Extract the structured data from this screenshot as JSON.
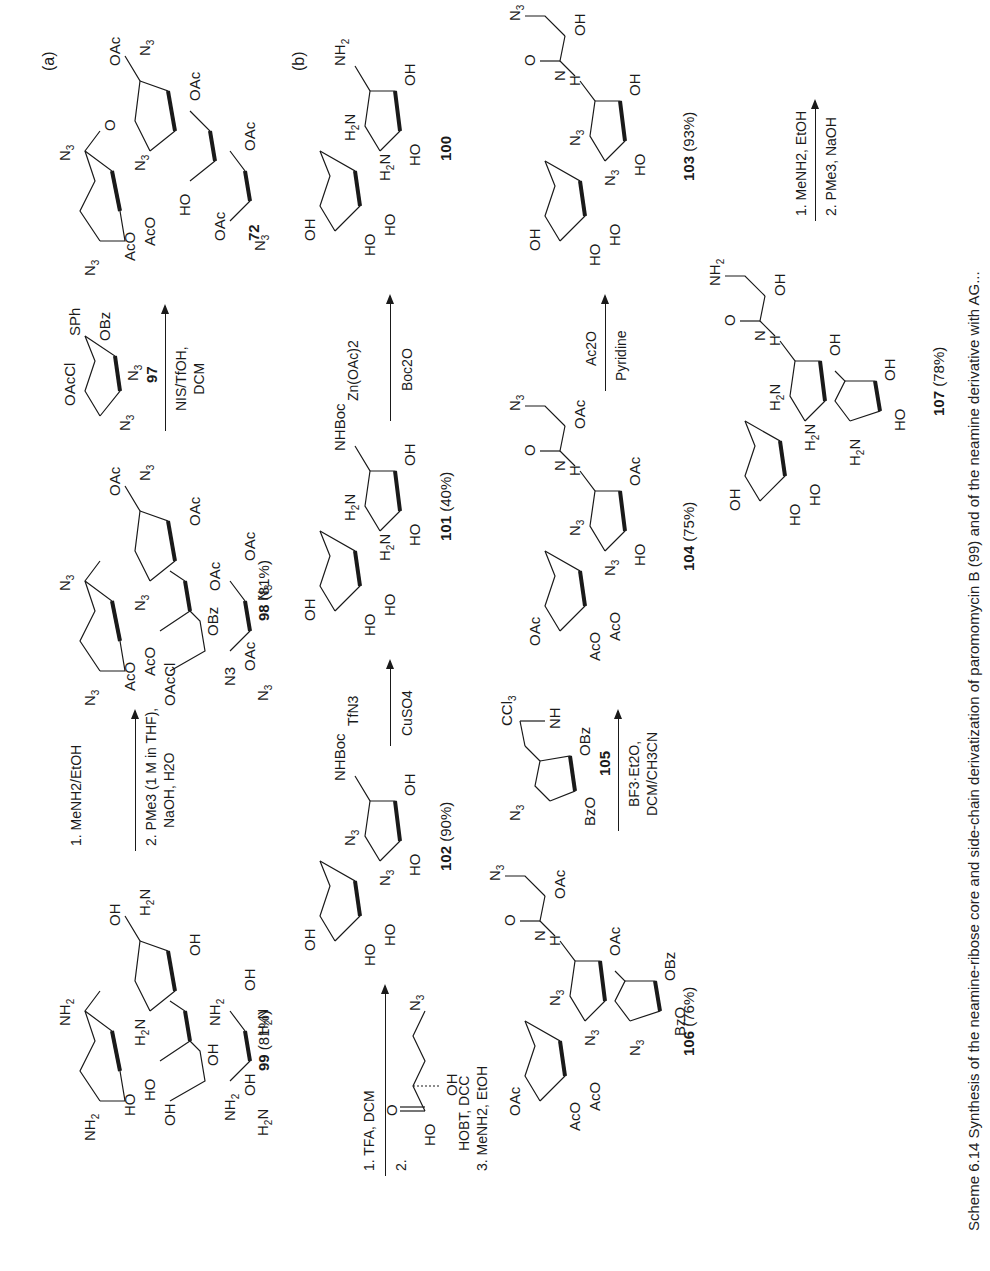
{
  "scheme": {
    "caption": "Scheme 6.14  Synthesis of the neamine-ribose core and side-chain derivatization of paromomycin B (99) and of the neamine derivative with AG...",
    "panel_a_label": "(a)",
    "panel_b_label": "(b)"
  },
  "row_a": {
    "start": {
      "id": "72",
      "groups": [
        "N3",
        "AcO",
        "AcO",
        "N3",
        "N3",
        "OAc",
        "N3",
        "OAc",
        "HO",
        "OAc",
        "OAc",
        "N3"
      ]
    },
    "step1": {
      "donor_id": "97",
      "donor_groups": [
        "OAcCl",
        "SPh",
        "OBz",
        "N3",
        "N3"
      ],
      "reagents": [
        "NIS/TfOH,",
        "DCM"
      ]
    },
    "product1": {
      "id": "98",
      "yield": "(81%)",
      "groups": [
        "N3",
        "AcO",
        "AcO",
        "OAcCl",
        "N3",
        "OBz",
        "N3",
        "N3",
        "OAc",
        "N3",
        "OAc",
        "OAc",
        "OAc",
        "N3",
        "N3"
      ]
    },
    "step2": {
      "reagents": [
        "1. MeNH2/EtOH",
        "2. PMe3 (1 M in THF),",
        "NaOH, H2O"
      ]
    },
    "product2": {
      "id": "99",
      "yield": "(81%)",
      "groups": [
        "NH2",
        "HO",
        "HO",
        "H2N",
        "OH",
        "H2N",
        "OH",
        "NH2",
        "OH",
        "NH2",
        "OH",
        "OH",
        "H2N",
        "NH2"
      ]
    }
  },
  "row_b1": {
    "start": {
      "id": "100",
      "groups": [
        "OH",
        "HO",
        "HO",
        "H2N",
        "H2N",
        "HO",
        "OH",
        "NH2"
      ]
    },
    "step1": {
      "above": "Zn(OAc)2",
      "below": "Boc2O"
    },
    "product1": {
      "id": "101",
      "yield": "(40%)",
      "groups": [
        "OH",
        "HO",
        "HO",
        "H2N",
        "H2N",
        "HO",
        "OH",
        "NHBoc"
      ]
    },
    "step2": {
      "above": "TfN3",
      "below": "CuSO4"
    },
    "product2": {
      "id": "102",
      "yield": "(90%)",
      "groups": [
        "OH",
        "HO",
        "HO",
        "N3",
        "N3",
        "HO",
        "OH",
        "NHBoc"
      ]
    },
    "step3": {
      "line1": "1. TFA, DCM",
      "line2_prefix": "2.",
      "acid_groups": [
        "O",
        "HO",
        "OH",
        "N3"
      ],
      "line3": "HOBT, DCC",
      "line4": "3. MeNH2, EtOH"
    }
  },
  "row_b2": {
    "start": {
      "id": "103",
      "yield": "(93%)",
      "groups": [
        "OH",
        "HO",
        "HO",
        "N3",
        "N3",
        "HO",
        "OH",
        "H",
        "N",
        "O",
        "OH",
        "N3"
      ]
    },
    "step1": {
      "above": "Ac2O",
      "below": "Pyridine"
    },
    "product1": {
      "id": "104",
      "yield": "(75%)",
      "groups": [
        "OAc",
        "AcO",
        "AcO",
        "N3",
        "N3",
        "HO",
        "OAc",
        "H",
        "N",
        "O",
        "OAc",
        "N3"
      ]
    },
    "step2": {
      "donor_id": "105",
      "donor_groups": [
        "N3",
        "CCl3",
        "NH",
        "OBz",
        "BzO"
      ],
      "reagents": [
        "BF3·Et2O,",
        "DCM/CH3CN"
      ]
    },
    "product2": {
      "id": "106",
      "yield": "(76%)",
      "groups": [
        "OAc",
        "AcO",
        "AcO",
        "N3",
        "N3",
        "OAc",
        "H",
        "N",
        "O",
        "OAc",
        "N3",
        "N3",
        "BzO",
        "OBz"
      ]
    }
  },
  "row_b3": {
    "step1": {
      "line1": "1. MeNH2, EtOH",
      "line2": "2. PMe3, NaOH"
    },
    "product": {
      "id": "107",
      "yield": "(78%)",
      "groups": [
        "OH",
        "HO",
        "HO",
        "H2N",
        "H2N",
        "OH",
        "H",
        "N",
        "O",
        "OH",
        "NH2",
        "H2N",
        "HO",
        "OH"
      ]
    }
  }
}
